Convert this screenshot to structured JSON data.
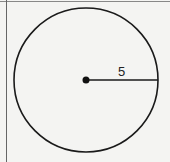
{
  "diagram": {
    "shape": "circle",
    "radius_label": "5",
    "center": {
      "x": 86,
      "y": 80
    },
    "radius_px": 72,
    "stroke_color": "#1a1a1a",
    "background_color": "#f4f4f2"
  }
}
